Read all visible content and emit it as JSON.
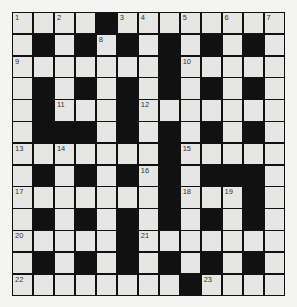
{
  "puzzle": {
    "type": "crossword",
    "rows": 13,
    "cols": 13,
    "layout": [
      "WWWWBWWWWWWWW",
      "WBWBWBWBWBWBW",
      "WWWWWWWBWWWWW",
      "WBWBWBWBWBWBW",
      "WBWWWBWWWWWWW",
      "WBBBWBWBWBWBW",
      "WWWWWWWBWWWWW",
      "WBWBWBWBWBBBW",
      "WWWWWWWBWWWBW",
      "WBWBWBWBWBWBW",
      "WWWWWBWWWWWWW",
      "WBWBWBWBWBWBW",
      "WWWWWWWWBWWWW"
    ],
    "numbers": [
      {
        "n": "1",
        "r": 0,
        "c": 0
      },
      {
        "n": "2",
        "r": 0,
        "c": 2
      },
      {
        "n": "3",
        "r": 0,
        "c": 5
      },
      {
        "n": "4",
        "r": 0,
        "c": 6
      },
      {
        "n": "5",
        "r": 0,
        "c": 8
      },
      {
        "n": "6",
        "r": 0,
        "c": 10
      },
      {
        "n": "7",
        "r": 0,
        "c": 12
      },
      {
        "n": "8",
        "r": 1,
        "c": 4
      },
      {
        "n": "9",
        "r": 2,
        "c": 0
      },
      {
        "n": "10",
        "r": 2,
        "c": 8
      },
      {
        "n": "11",
        "r": 4,
        "c": 2
      },
      {
        "n": "12",
        "r": 4,
        "c": 6
      },
      {
        "n": "13",
        "r": 6,
        "c": 0
      },
      {
        "n": "14",
        "r": 6,
        "c": 2
      },
      {
        "n": "15",
        "r": 6,
        "c": 8
      },
      {
        "n": "16",
        "r": 7,
        "c": 6
      },
      {
        "n": "17",
        "r": 8,
        "c": 0
      },
      {
        "n": "18",
        "r": 8,
        "c": 8
      },
      {
        "n": "19",
        "r": 8,
        "c": 10
      },
      {
        "n": "20",
        "r": 10,
        "c": 0
      },
      {
        "n": "21",
        "r": 10,
        "c": 6
      },
      {
        "n": "22",
        "r": 12,
        "c": 0
      },
      {
        "n": "23",
        "r": 12,
        "c": 9
      }
    ]
  }
}
